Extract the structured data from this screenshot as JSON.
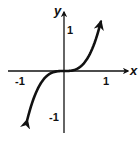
{
  "chart_data": {
    "type": "line",
    "title": "",
    "function": "y = x^3",
    "xlabel": "x",
    "ylabel": "y",
    "x_ticks": [
      "-1",
      "1"
    ],
    "y_ticks": [
      "1",
      "-1"
    ],
    "xlim": [
      -1.5,
      1.5
    ],
    "ylim": [
      -1.5,
      1.5
    ],
    "grid": false,
    "legend": null,
    "series": [
      {
        "name": "y = x^3",
        "x": [
          -1.1,
          -1.0,
          -0.8,
          -0.6,
          -0.4,
          -0.2,
          0,
          0.2,
          0.4,
          0.6,
          0.8,
          1.0,
          1.1
        ],
        "y": [
          -1.331,
          -1.0,
          -0.512,
          -0.216,
          -0.064,
          -0.008,
          0,
          0.008,
          0.064,
          0.216,
          0.512,
          1.0,
          1.331
        ],
        "arrows_at_ends": true
      }
    ]
  },
  "labels": {
    "x_axis": "x",
    "y_axis": "y",
    "x_tick_neg": "-1",
    "x_tick_pos": "1",
    "y_tick_pos": "1",
    "y_tick_neg": "-1"
  },
  "colors": {
    "ink": "#111111",
    "background": "#ffffff"
  }
}
